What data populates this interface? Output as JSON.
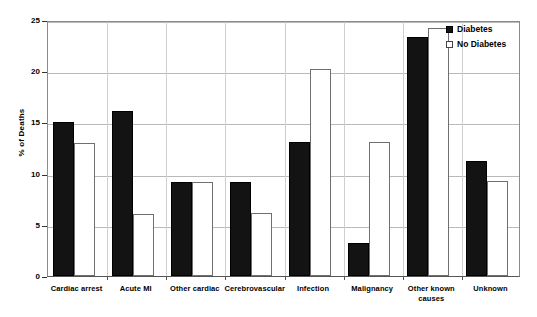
{
  "chart_data": {
    "type": "bar",
    "title": "",
    "xlabel": "",
    "ylabel": "% of Deaths",
    "ylim": [
      0,
      25
    ],
    "yticks": [
      0,
      5,
      10,
      15,
      20,
      25
    ],
    "grid": true,
    "legend_position": "top-right",
    "categories": [
      "Cardiac arrest",
      "Acute MI",
      "Other cardiac",
      "Cerebrovascular",
      "Infection",
      "Malignancy",
      "Other known causes",
      "Unknown"
    ],
    "series": [
      {
        "name": "Diabetes",
        "style": "filled",
        "color": "#131313",
        "values": [
          15.0,
          16.1,
          9.2,
          9.2,
          13.1,
          3.2,
          23.3,
          11.2
        ]
      },
      {
        "name": "No Diabetes",
        "style": "hollow",
        "color": "#ffffff",
        "values": [
          13.0,
          6.1,
          9.2,
          6.2,
          20.2,
          13.1,
          24.2,
          9.3
        ]
      }
    ]
  },
  "axis": {
    "y_title": "% of Deaths",
    "y_tick_labels": [
      "0",
      "5",
      "10",
      "15",
      "20",
      "25"
    ]
  },
  "legend": {
    "items": [
      {
        "label": "Diabetes",
        "swatch": "filled-square-icon"
      },
      {
        "label": "No Diabetes",
        "swatch": "hollow-square-icon"
      }
    ]
  }
}
